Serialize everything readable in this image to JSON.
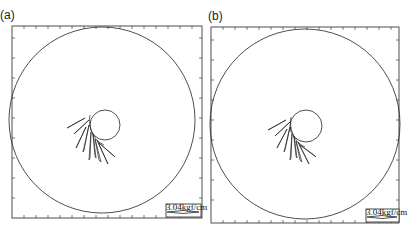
{
  "panels": [
    {
      "label": "(a)",
      "frame": {
        "x": 12,
        "y": 26,
        "w": 190,
        "h": 192
      },
      "outer_circle": {
        "cx": 102,
        "cy": 120,
        "r": 91
      },
      "inner_circle": {
        "cx": 105,
        "cy": 125,
        "r": 15
      },
      "scale_label": "3.04kgf/cm"
    },
    {
      "label": "(b)",
      "frame": {
        "x": 211,
        "y": 27,
        "w": 188,
        "h": 196
      },
      "outer_circle": {
        "cx": 304,
        "cy": 125,
        "r": 94
      },
      "inner_circle": {
        "cx": 306,
        "cy": 126,
        "r": 16
      },
      "scale_label": "3.04kgf/cm"
    }
  ]
}
